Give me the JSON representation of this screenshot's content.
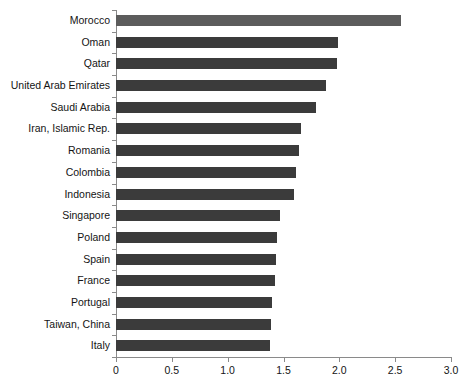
{
  "chart_data": {
    "type": "bar",
    "orientation": "horizontal",
    "title": "",
    "subtitle": "",
    "xlabel": "",
    "ylabel": "",
    "xlim": [
      0,
      3.0
    ],
    "grid": false,
    "legend": null,
    "xticks": [
      "0",
      "0.5",
      "1.0",
      "1.5",
      "2.0",
      "2.5",
      "3.0"
    ],
    "xtick_values": [
      0,
      0.5,
      1.0,
      1.5,
      2.0,
      2.5,
      3.0
    ],
    "categories": [
      "Morocco",
      "Oman",
      "Qatar",
      "United Arab Emirates",
      "Saudi Arabia",
      "Iran, Islamic Rep.",
      "Romania",
      "Colombia",
      "Indonesia",
      "Singapore",
      "Poland",
      "Spain",
      "France",
      "Portugal",
      "Taiwan, China",
      "Italy"
    ],
    "values": [
      2.55,
      1.99,
      1.98,
      1.88,
      1.79,
      1.66,
      1.64,
      1.61,
      1.59,
      1.47,
      1.44,
      1.43,
      1.42,
      1.4,
      1.39,
      1.38
    ],
    "highlight_index": 0,
    "colors": {
      "bar": "#3b3b3b",
      "bar_highlight": "#5c5c5c",
      "axis": "#8a8a8a",
      "text": "#141414",
      "background": "#ffffff"
    }
  }
}
